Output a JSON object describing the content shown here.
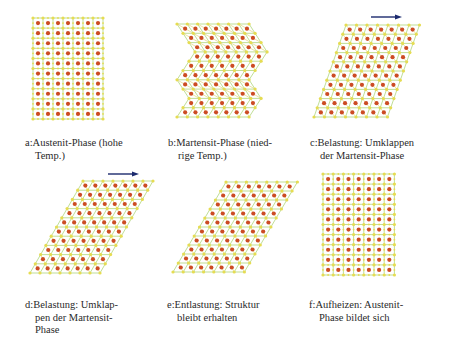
{
  "figure": {
    "colors": {
      "bond_green": "#9ccb5a",
      "bond_yellow": "#e3d36a",
      "corner_atom": "#e6dc52",
      "center_atom": "#cc4b24",
      "arrow": "#1c2a6e"
    },
    "panels": [
      {
        "id": "a",
        "type": "square",
        "label": "a:",
        "caption_lines": [
          "Austenit-Phase (hohe",
          "Temp.)"
        ],
        "lattice": {
          "x0": 33,
          "y0": 18,
          "cols": 7,
          "rows": 10,
          "cell_w": 10,
          "cell_h": 10.1
        },
        "caption_pos": {
          "x": 25,
          "y": 137
        },
        "arrow": null
      },
      {
        "id": "b",
        "type": "zigzag",
        "label": "b:",
        "caption_lines": [
          "Martensit-Phase (nied-",
          "rige Temp.)"
        ],
        "lattice": {
          "x0": 177,
          "y0": 24,
          "cols": 7,
          "rows": 10,
          "cell_w": 10.3,
          "cell_h": 9.3,
          "shear": 6,
          "segments": [
            3,
            3,
            2,
            2
          ]
        },
        "caption_pos": {
          "x": 168,
          "y": 137
        },
        "arrow": null
      },
      {
        "id": "c",
        "type": "sheared",
        "label": "c:",
        "caption_lines": [
          "Belastung: Umklappen",
          "der Martensit-Phase"
        ],
        "lattice": {
          "x0": 346,
          "y0": 25,
          "cols": 7,
          "rows": 10,
          "cell_w": 10.5,
          "cell_h": 9.2,
          "shear": 3.2,
          "notch_top": true,
          "notch_bottom": true
        },
        "caption_pos": {
          "x": 310,
          "y": 137
        },
        "arrow": {
          "x1": 371,
          "x2": 402,
          "y": 17
        }
      },
      {
        "id": "d",
        "type": "sheared",
        "label": "d:",
        "caption_lines": [
          "Belastung: Umklap-",
          "pen der Martensit-",
          "Phase"
        ],
        "lattice": {
          "x0": 83,
          "y0": 181,
          "cols": 7,
          "rows": 10,
          "cell_w": 10,
          "cell_h": 9.2,
          "shear": 5.3,
          "notch_top": false,
          "notch_bottom": true
        },
        "caption_pos": {
          "x": 25,
          "y": 299
        },
        "arrow": {
          "x1": 108,
          "x2": 139,
          "y": 174
        }
      },
      {
        "id": "e",
        "type": "sheared",
        "label": "e:",
        "caption_lines": [
          "Entlastung: Struktur",
          "bleibt erhalten"
        ],
        "lattice": {
          "x0": 226,
          "y0": 182,
          "cols": 7,
          "rows": 10,
          "cell_w": 10.2,
          "cell_h": 9.0,
          "shear": 5.3,
          "notch_top": false,
          "notch_bottom": true
        },
        "caption_pos": {
          "x": 167,
          "y": 299
        },
        "arrow": null
      },
      {
        "id": "f",
        "type": "square",
        "label": "f:",
        "caption_lines": [
          "Aufheizen: Austenit-",
          "Phase bildet sich"
        ],
        "lattice": {
          "x0": 323,
          "y0": 174,
          "cols": 7,
          "rows": 10,
          "cell_w": 10.2,
          "cell_h": 10.1
        },
        "caption_pos": {
          "x": 309,
          "y": 299
        },
        "arrow": null
      }
    ]
  }
}
